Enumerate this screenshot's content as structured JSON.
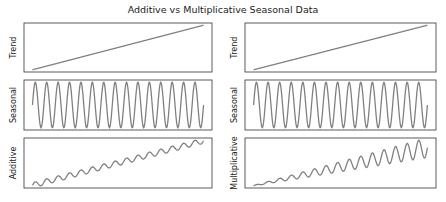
{
  "chart_data": [
    {
      "type": "line",
      "title": "Additive vs Multiplicative Seasonal Data",
      "panels": [
        {
          "col": 0,
          "row": 0,
          "ylabel": "Trend",
          "kind": "trend"
        },
        {
          "col": 0,
          "row": 1,
          "ylabel": "Seasonal",
          "kind": "seasonal"
        },
        {
          "col": 0,
          "row": 2,
          "ylabel": "Additive",
          "kind": "additive"
        },
        {
          "col": 1,
          "row": 0,
          "ylabel": "Trend",
          "kind": "trend"
        },
        {
          "col": 1,
          "row": 1,
          "ylabel": "Seasonal",
          "kind": "seasonal"
        },
        {
          "col": 1,
          "row": 2,
          "ylabel": "Multiplicative",
          "kind": "multiplicative"
        }
      ],
      "x_range": [
        0,
        100
      ],
      "cycles": 15,
      "trend": {
        "start": 0,
        "end": 10
      },
      "seasonal_amplitude": 1,
      "grid": false,
      "line_color": "#808080"
    }
  ],
  "title": "Additive vs Multiplicative Seasonal Data"
}
